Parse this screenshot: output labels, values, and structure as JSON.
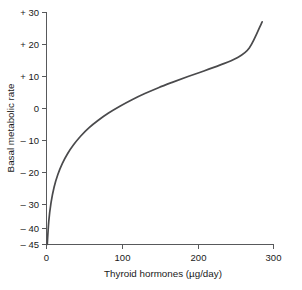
{
  "chart_data": {
    "type": "line",
    "title": "",
    "xlabel": "Thyroid hormones (µg/day)",
    "ylabel": "Basal metabolic rate",
    "xlim": [
      0,
      300
    ],
    "ylim": [
      -45,
      30
    ],
    "grid": false,
    "legend": null,
    "xticks": [
      0,
      100,
      200,
      300
    ],
    "xticklabels": [
      "0",
      "100",
      "200",
      "300"
    ],
    "yticks": [
      30,
      20,
      10,
      0,
      -10,
      -20,
      -30,
      -40,
      -45
    ],
    "yticklabels": [
      "+ 30",
      "+ 20",
      "+ 10",
      "0",
      "– 10",
      "– 20",
      "– 30",
      "– 40",
      "– 45"
    ],
    "series": [
      {
        "name": "Basal metabolic rate",
        "color": "#4a4a4c",
        "x": [
          1,
          3,
          6,
          10,
          15,
          21,
          28,
          36,
          45,
          56,
          68,
          82,
          97,
          113,
          130,
          148,
          167,
          187,
          208,
          229,
          250,
          268,
          285
        ],
        "y": [
          -45,
          -37.5,
          -31.5,
          -26.5,
          -22.4,
          -18.8,
          -15.6,
          -12.7,
          -10.0,
          -7.3,
          -4.9,
          -2.5,
          -0.3,
          1.8,
          3.8,
          5.7,
          7.5,
          9.3,
          11.1,
          13.0,
          15.1,
          18.5,
          27.0
        ]
      }
    ]
  },
  "labels": {
    "x_axis_title": "Thyroid hormones (µg/day)",
    "y_axis_title": "Basal metabolic rate"
  },
  "colors": {
    "curve": "#4a4a4c",
    "axis": "#58595b",
    "text": "#1a1a1a",
    "background": "#ffffff"
  }
}
